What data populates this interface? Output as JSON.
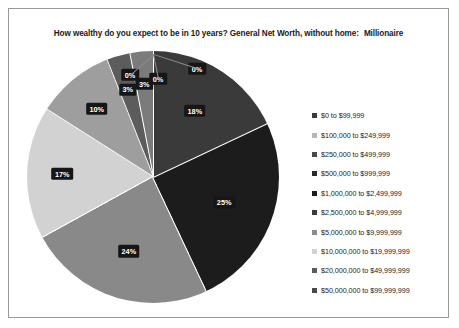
{
  "chart_data": {
    "type": "pie",
    "title": "How wealthy do you expect to be in 10 years? General Net Worth, without home:",
    "title_emphasis": "Millionaire",
    "categories": [
      "$0 to $99,999",
      "$100,000 to $249,999",
      "$250,000 to $499,999",
      "$500,000 to $999,999",
      "$1,000,000 to $2,499,999",
      "$2,500,000 to $4,999,999",
      "$5,000,000 to $9,999,999",
      "$10,000,000 to $19,999,999",
      "$20,000,000 to $49,999,999",
      "$50,000,000 to $99,999,999"
    ],
    "values": [
      18,
      25,
      24,
      17,
      10,
      3,
      3,
      0,
      0,
      0
    ],
    "labels": [
      "18%",
      "25%",
      "24%",
      "17%",
      "10%",
      "3%",
      "3%",
      "0%",
      "0%",
      "0%"
    ],
    "colors": [
      "#3a3a3a",
      "#1c1c1c",
      "#898989",
      "#d2d2d2",
      "#9e9e9e",
      "#5c5c5c",
      "#7b7b7b",
      "#2b2b2b",
      "#6a6a6a",
      "#4a4a4a"
    ],
    "legend_position": "right",
    "grid": false,
    "label_style": "white-on-black"
  },
  "legend": {
    "items": [
      {
        "label": "$0 to $99,999",
        "color": "#3a3a3a"
      },
      {
        "label": "$100,000 to $249,999",
        "color": "#b8b8b8"
      },
      {
        "label": "$250,000 to $499,999",
        "color": "#4a4a4a"
      },
      {
        "label": "$500,000 to $999,999",
        "color": "#2b2b2b"
      },
      {
        "label": "$1,000,000 to $2,499,999",
        "color": "#1c1c1c"
      },
      {
        "label": "$2,500,000 to $4,999,999",
        "color": "#3a3a3a"
      },
      {
        "label": "$5,000,000 to $9,999,999",
        "color": "#8d8d8d"
      },
      {
        "label": "$10,000,000 to $19,999,999",
        "color": "#d2d2d2"
      },
      {
        "label": "$20,000,000 to $49,999,999",
        "color": "#5c5c5c"
      },
      {
        "label": "$50,000,000 to $99,999,999",
        "color": "#4a4a4a"
      }
    ]
  }
}
